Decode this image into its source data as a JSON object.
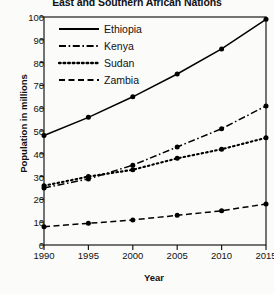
{
  "chart_data": {
    "type": "line",
    "title": "East and Southern African Nations",
    "xlabel": "Year",
    "ylabel": "Population in millions",
    "x": [
      1990,
      1995,
      2000,
      2005,
      2010,
      2015
    ],
    "xticklabels": [
      "1990",
      "1995",
      "2000",
      "2005",
      "2010",
      "2015"
    ],
    "yticks": [
      0,
      10,
      20,
      30,
      40,
      50,
      60,
      70,
      80,
      90,
      100
    ],
    "yticklabels": [
      "0",
      "10",
      "20",
      "30",
      "40",
      "50",
      "60",
      "70",
      "80",
      "90",
      "100"
    ],
    "ylim": [
      0,
      100
    ],
    "xlim": [
      1990,
      2015
    ],
    "grid": false,
    "legend_position": "upper-left-inside",
    "markers": "filled-circle",
    "series": [
      {
        "name": "Ethiopia",
        "style": "solid",
        "color": "#000000",
        "values": [
          48,
          56,
          65,
          75,
          86,
          99
        ]
      },
      {
        "name": "Kenya",
        "style": "dash-dot",
        "color": "#000000",
        "values": [
          25,
          29,
          35,
          43,
          51,
          61
        ]
      },
      {
        "name": "Sudan",
        "style": "dotted",
        "color": "#000000",
        "values": [
          26,
          30,
          33,
          38,
          42,
          47
        ]
      },
      {
        "name": "Zambia",
        "style": "dashed",
        "color": "#000000",
        "values": [
          8,
          9.5,
          11,
          13,
          15,
          18
        ]
      }
    ]
  }
}
